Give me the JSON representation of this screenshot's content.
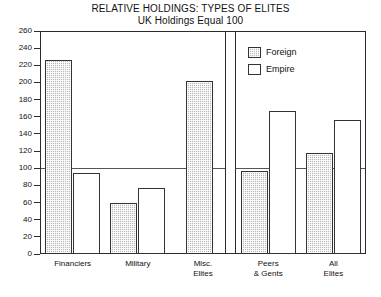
{
  "chart_data": {
    "type": "bar",
    "title": "RELATIVE HOLDINGS: TYPES OF ELITES",
    "subtitle": "UK Holdings Equal 100",
    "xlabel": "",
    "ylabel": "",
    "ylim": [
      0,
      260
    ],
    "ytick_step": 20,
    "yticks": [
      260,
      240,
      220,
      200,
      180,
      160,
      140,
      120,
      100,
      80,
      60,
      40,
      20,
      0
    ],
    "grid": false,
    "reference_line": 100,
    "legend_position": "top-right",
    "categories": [
      "Financiers",
      "Military",
      "Misc. Elites",
      "Peers & Gents",
      "All Elites"
    ],
    "series": [
      {
        "name": "Foreign",
        "values": [
          226,
          60,
          202,
          97,
          118
        ]
      },
      {
        "name": "Empire",
        "values": [
          94,
          77,
          null,
          167,
          156
        ]
      }
    ]
  },
  "legend": {
    "items": [
      {
        "label": "Foreign",
        "swatch": "hatched-gray"
      },
      {
        "label": "Empire",
        "swatch": "white"
      }
    ]
  },
  "axis": {
    "y_tick_labels": [
      "260",
      "240",
      "220",
      "200",
      "180",
      "160",
      "140",
      "120",
      "100",
      "80",
      "60",
      "40",
      "20",
      "0"
    ],
    "x_tick_labels": [
      "Financiers",
      "Military",
      "Misc.\nElites",
      "Peers\n& Gents",
      "All\nElites"
    ]
  },
  "colors": {
    "foreign_fill": "#b9b9b9",
    "empire_fill": "#ffffff",
    "axis": "#2b2b2b",
    "reference_line": "#555555",
    "text": "#111111"
  }
}
